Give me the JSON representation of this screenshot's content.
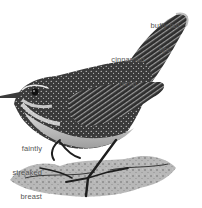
{
  "figure": {
    "palette": {
      "background": "#ffffff",
      "label_text": "#555555",
      "plumage_dark": "#2a2a2a",
      "plumage_mid": "#6e6e6e",
      "plumage_light": "#cfcfcf",
      "rock": "#9a9a9a"
    }
  },
  "annotations": [
    {
      "id": "tail",
      "lines": [
        "buffy tail",
        "tips"
      ]
    },
    {
      "id": "rump",
      "lines": [
        "cinnamon",
        "rump"
      ]
    },
    {
      "id": "breast",
      "lines": [
        "faintly",
        "streaked",
        "breast"
      ]
    }
  ]
}
